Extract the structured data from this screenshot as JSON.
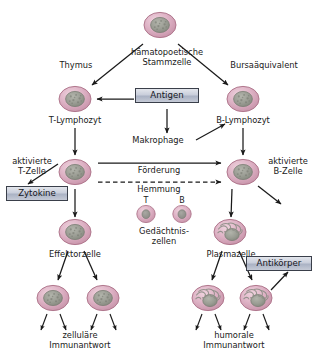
{
  "diagram": {
    "colors": {
      "cell_membrane": "#d9a8bc",
      "cell_membrane_edge": "#b5778f",
      "cell_cytoplasm": "#e2bccb",
      "nucleus": "#9a9c95",
      "nucleus_edge": "#7d8078",
      "box_fill": "#c9cedb",
      "box_border": "#3a3f4a",
      "arrow": "#1a1a1a",
      "text": "#1a1a1a"
    }
  },
  "labels": {
    "stem_cell": "hämatopoetische\nStammzelle",
    "thymus": "Thymus",
    "bursa": "Bursaäquivalent",
    "t_lymphocyte": "T-Lymphozyt",
    "b_lymphocyte": "B-Lymphozyt",
    "macrophage": "Makrophage",
    "activated_t_cell": "aktivierte\nT-Zelle",
    "activated_b_cell": "aktivierte\nB-Zelle",
    "promotion": "Förderung",
    "inhibition": "Hemmung",
    "memory_t": "T",
    "memory_b": "B",
    "memory_cells": "Gedächtnis-\nzellen",
    "effector_cell": "Effektorzelle",
    "plasma_cell": "Plasmazelle",
    "cellular_response": "zelluläre\nImmunantwort",
    "humoral_response": "humorale\nImmunantwort"
  },
  "boxes": {
    "antigen": "Antigen",
    "cytokines": "Zytokine",
    "antibodies": "Antikörper"
  },
  "cells": [
    {
      "name": "stem-cell",
      "type": "nucleated",
      "x": 160,
      "y": 25
    },
    {
      "name": "t-lymphocyte",
      "type": "nucleated",
      "x": 75,
      "y": 99
    },
    {
      "name": "b-lymphocyte",
      "type": "nucleated",
      "x": 243,
      "y": 99
    },
    {
      "name": "activated-t-cell",
      "type": "nucleated",
      "x": 75,
      "y": 172
    },
    {
      "name": "activated-b-cell",
      "type": "nucleated",
      "x": 243,
      "y": 172
    },
    {
      "name": "memory-t-cell",
      "type": "small",
      "x": 146,
      "y": 214
    },
    {
      "name": "memory-b-cell",
      "type": "small",
      "x": 182,
      "y": 214
    },
    {
      "name": "effector-cell",
      "type": "nucleated",
      "x": 75,
      "y": 232
    },
    {
      "name": "plasma-cell",
      "type": "plasma",
      "x": 230,
      "y": 232
    },
    {
      "name": "effector-daughter-left",
      "type": "nucleated",
      "x": 53,
      "y": 298
    },
    {
      "name": "effector-daughter-right",
      "type": "nucleated",
      "x": 103,
      "y": 298
    },
    {
      "name": "plasma-daughter-left",
      "type": "plasma",
      "x": 208,
      "y": 298
    },
    {
      "name": "plasma-daughter-right",
      "type": "plasma",
      "x": 256,
      "y": 298
    }
  ]
}
